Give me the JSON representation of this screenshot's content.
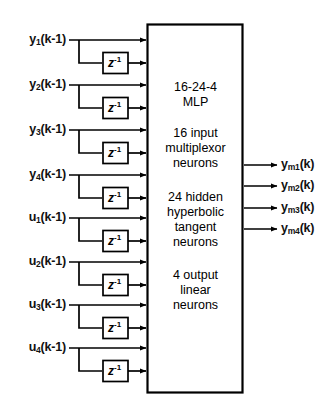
{
  "diagram": {
    "mlp_box": {
      "name": "mlp-block",
      "lines": [
        "16-24-4",
        "MLP",
        "",
        "16 input",
        "multiplexor",
        "neurons",
        "",
        "24 hidden",
        "hyperbolic",
        "tangent",
        "neurons",
        "",
        "4 output",
        "linear",
        "neurons"
      ],
      "groups": [
        {
          "id": "arch",
          "text": "16-24-4 MLP"
        },
        {
          "id": "input-layer",
          "text": "16 input multiplexor neurons"
        },
        {
          "id": "hidden-layer",
          "text": "24 hidden hyperbolic tangent neurons"
        },
        {
          "id": "output-layer",
          "text": "4 output linear neurons"
        }
      ]
    },
    "delay_label": "z",
    "delay_exponent": "-1",
    "inputs": [
      {
        "base": "y",
        "sub": "1",
        "suffix": "(k-1)",
        "text": "y1(k-1)"
      },
      {
        "base": "y",
        "sub": "2",
        "suffix": "(k-1)",
        "text": "y2(k-1)"
      },
      {
        "base": "y",
        "sub": "3",
        "suffix": "(k-1)",
        "text": "y3(k-1)"
      },
      {
        "base": "y",
        "sub": "4",
        "suffix": "(k-1)",
        "text": "y4(k-1)"
      },
      {
        "base": "u",
        "sub": "1",
        "suffix": "(k-1)",
        "text": "u1(k-1)"
      },
      {
        "base": "u",
        "sub": "2",
        "suffix": "(k-1)",
        "text": "u2(k-1)"
      },
      {
        "base": "u",
        "sub": "3",
        "suffix": "(k-1)",
        "text": "u3(k-1)"
      },
      {
        "base": "u",
        "sub": "4",
        "suffix": "(k-1)",
        "text": "u4(k-1)"
      }
    ],
    "outputs": [
      {
        "base": "y",
        "sub": "m1",
        "suffix": "(k)",
        "text": "ym1(k)"
      },
      {
        "base": "y",
        "sub": "m2",
        "suffix": "(k)",
        "text": "ym2(k)"
      },
      {
        "base": "y",
        "sub": "m3",
        "suffix": "(k)",
        "text": "ym3(k)"
      },
      {
        "base": "y",
        "sub": "m4",
        "suffix": "(k)",
        "text": "ym4(k)"
      }
    ],
    "colors": {
      "stroke": "#000000",
      "background": "#ffffff"
    }
  }
}
